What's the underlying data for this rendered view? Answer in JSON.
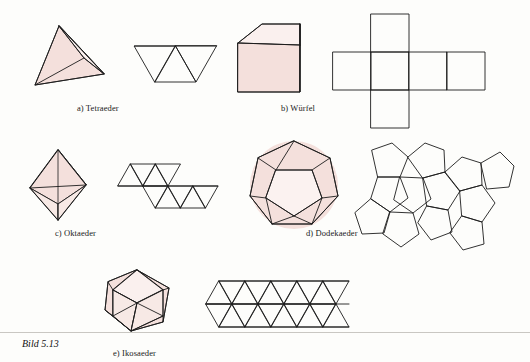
{
  "figure": {
    "number_label": "Bild 5.13",
    "captions": [
      {
        "id": "a",
        "text": "a) Tetraeder"
      },
      {
        "id": "b",
        "text": "b) Würfel"
      },
      {
        "id": "c",
        "text": "c) Oktaeder"
      },
      {
        "id": "d",
        "text": "d) Dodekaeder"
      },
      {
        "id": "e",
        "text": "e) Ikosaeder"
      }
    ],
    "colors": {
      "stroke": "#1c1c1c",
      "face_fill": "#f4e0dc",
      "face_fill_light": "#faf0ee",
      "paper": "#fdfdfb",
      "text": "#1a1a1a"
    },
    "solids": [
      {
        "name": "Tetraeder",
        "caption": "a) Tetraeder",
        "faces": 4,
        "face_shape": "triangle",
        "has_solid_view": true,
        "has_net_view": true
      },
      {
        "name": "Würfel",
        "caption": "b) Würfel",
        "faces": 6,
        "face_shape": "square",
        "has_solid_view": true,
        "has_net_view": true
      },
      {
        "name": "Oktaeder",
        "caption": "c) Oktaeder",
        "faces": 8,
        "face_shape": "triangle",
        "has_solid_view": true,
        "has_net_view": true
      },
      {
        "name": "Dodekaeder",
        "caption": "d) Dodekaeder",
        "faces": 12,
        "face_shape": "pentagon",
        "has_solid_view": true,
        "has_net_view": true
      },
      {
        "name": "Ikosaeder",
        "caption": "e) Ikosaeder",
        "faces": 20,
        "face_shape": "triangle",
        "has_solid_view": true,
        "has_net_view": true
      }
    ]
  }
}
